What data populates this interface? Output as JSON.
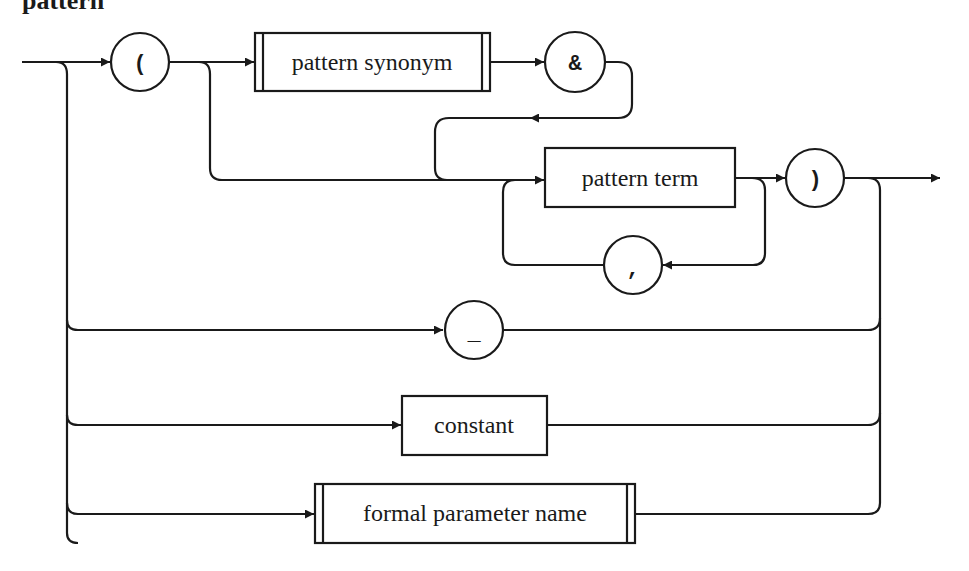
{
  "diagram": {
    "title": "pattern",
    "type": "syntax-railroad-diagram",
    "terminals": {
      "open_paren": "(",
      "ampersand": "&",
      "close_paren": ")",
      "comma": ",",
      "underscore": "_"
    },
    "nonterminals": {
      "pattern_synonym": "pattern synonym",
      "pattern_term": "pattern term",
      "constant": "constant",
      "formal_parameter_name": "formal parameter name"
    },
    "alternatives": [
      "( [pattern synonym &] pattern term {, pattern term} )",
      "_",
      "constant",
      "formal parameter name"
    ],
    "colors": {
      "stroke": "#1a1a1a",
      "background": "#ffffff"
    }
  }
}
